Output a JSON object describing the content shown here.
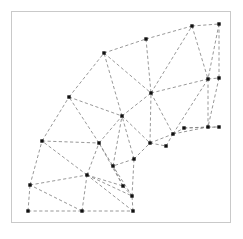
{
  "figure": {
    "border_color": "#c9c9c9",
    "background_color": "#ffffff",
    "edge_color": "#7d7d7d",
    "node_color": "#111111",
    "edge_style": "dashed",
    "node_marker": "square",
    "node_size": 3.4,
    "frame": {
      "x": 11,
      "y": 11,
      "width": 220,
      "height": 212
    }
  },
  "mesh_data": {
    "type": "mesh",
    "description": "Quarter annulus sector meshed with triangular elements; nodes drawn as filled black squares, element edges as dashed gray lines.",
    "node_count": 26,
    "element_count": 32,
    "nodes": [
      {
        "id": 0,
        "x": 28,
        "y": 211
      },
      {
        "id": 1,
        "x": 82,
        "y": 211
      },
      {
        "id": 2,
        "x": 133,
        "y": 211
      },
      {
        "id": 3,
        "x": 30,
        "y": 185
      },
      {
        "id": 4,
        "x": 87,
        "y": 175
      },
      {
        "id": 5,
        "x": 123,
        "y": 186
      },
      {
        "id": 6,
        "x": 132,
        "y": 196
      },
      {
        "id": 7,
        "x": 42,
        "y": 141
      },
      {
        "id": 8,
        "x": 99,
        "y": 143
      },
      {
        "id": 9,
        "x": 134,
        "y": 159
      },
      {
        "id": 10,
        "x": 113,
        "y": 166
      },
      {
        "id": 11,
        "x": 69,
        "y": 97
      },
      {
        "id": 12,
        "x": 122,
        "y": 116
      },
      {
        "id": 13,
        "x": 150,
        "y": 143
      },
      {
        "id": 14,
        "x": 104,
        "y": 53
      },
      {
        "id": 15,
        "x": 146,
        "y": 39
      },
      {
        "id": 16,
        "x": 151,
        "y": 93
      },
      {
        "id": 17,
        "x": 166,
        "y": 146
      },
      {
        "id": 18,
        "x": 173,
        "y": 134
      },
      {
        "id": 19,
        "x": 184,
        "y": 128
      },
      {
        "id": 20,
        "x": 192,
        "y": 26
      },
      {
        "id": 21,
        "x": 219,
        "y": 24
      },
      {
        "id": 22,
        "x": 208,
        "y": 79
      },
      {
        "id": 23,
        "x": 219,
        "y": 78
      },
      {
        "id": 24,
        "x": 208,
        "y": 127
      },
      {
        "id": 25,
        "x": 219,
        "y": 127
      }
    ],
    "elements": [
      [
        0,
        1,
        3
      ],
      [
        1,
        4,
        3
      ],
      [
        1,
        2,
        4
      ],
      [
        2,
        6,
        4
      ],
      [
        3,
        4,
        7
      ],
      [
        4,
        8,
        7
      ],
      [
        4,
        5,
        8
      ],
      [
        5,
        10,
        8
      ],
      [
        5,
        6,
        10
      ],
      [
        6,
        9,
        10
      ],
      [
        7,
        8,
        11
      ],
      [
        8,
        12,
        11
      ],
      [
        8,
        10,
        12
      ],
      [
        10,
        9,
        12
      ],
      [
        9,
        13,
        12
      ],
      [
        13,
        17,
        12
      ],
      [
        11,
        12,
        14
      ],
      [
        12,
        16,
        14
      ],
      [
        14,
        16,
        15
      ],
      [
        12,
        13,
        16
      ],
      [
        13,
        18,
        16
      ],
      [
        17,
        18,
        13
      ],
      [
        15,
        16,
        20
      ],
      [
        16,
        22,
        20
      ],
      [
        20,
        22,
        21
      ],
      [
        21,
        22,
        23
      ],
      [
        16,
        18,
        22
      ],
      [
        18,
        24,
        22
      ],
      [
        18,
        19,
        24
      ],
      [
        19,
        25,
        24
      ],
      [
        22,
        24,
        23
      ],
      [
        23,
        24,
        25
      ]
    ],
    "edges": [
      [
        0,
        1
      ],
      [
        1,
        2
      ],
      [
        0,
        3
      ],
      [
        1,
        3
      ],
      [
        1,
        4
      ],
      [
        3,
        4
      ],
      [
        2,
        4
      ],
      [
        2,
        6
      ],
      [
        4,
        6
      ],
      [
        3,
        7
      ],
      [
        4,
        7
      ],
      [
        4,
        8
      ],
      [
        7,
        8
      ],
      [
        4,
        5
      ],
      [
        5,
        8
      ],
      [
        5,
        10
      ],
      [
        8,
        10
      ],
      [
        5,
        6
      ],
      [
        6,
        10
      ],
      [
        6,
        9
      ],
      [
        9,
        10
      ],
      [
        7,
        11
      ],
      [
        8,
        11
      ],
      [
        8,
        12
      ],
      [
        11,
        12
      ],
      [
        10,
        12
      ],
      [
        9,
        12
      ],
      [
        9,
        13
      ],
      [
        12,
        13
      ],
      [
        11,
        14
      ],
      [
        12,
        14
      ],
      [
        14,
        16
      ],
      [
        12,
        16
      ],
      [
        14,
        15
      ],
      [
        15,
        16
      ],
      [
        13,
        16
      ],
      [
        13,
        17
      ],
      [
        13,
        18
      ],
      [
        17,
        18
      ],
      [
        16,
        18
      ],
      [
        15,
        20
      ],
      [
        16,
        20
      ],
      [
        16,
        22
      ],
      [
        20,
        22
      ],
      [
        20,
        21
      ],
      [
        21,
        22
      ],
      [
        21,
        23
      ],
      [
        22,
        23
      ],
      [
        18,
        22
      ],
      [
        18,
        24
      ],
      [
        18,
        19
      ],
      [
        19,
        24
      ],
      [
        19,
        25
      ],
      [
        22,
        24
      ],
      [
        23,
        24
      ],
      [
        24,
        25
      ]
    ]
  }
}
